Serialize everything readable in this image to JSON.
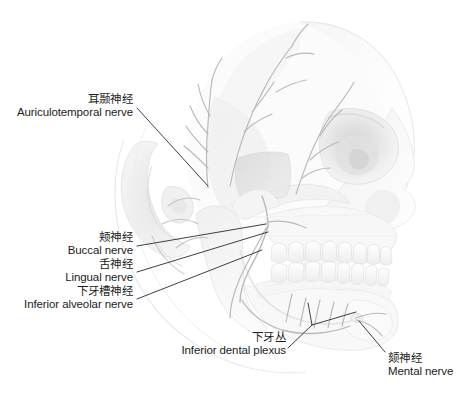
{
  "figure": {
    "type": "anatomical-illustration",
    "view": "lateral",
    "background_color": "#ffffff",
    "line_color": "#2a2a2a",
    "art_tone_light": "#fafafa",
    "art_tone_mid": "#e6e6e6",
    "art_tone_dark": "#c9c9c9"
  },
  "labels": [
    {
      "id": "auriculotemporal",
      "zh": "耳颞神经",
      "en": "Auriculotemporal nerve",
      "align": "right"
    },
    {
      "id": "buccal",
      "zh": "颊神经",
      "en": "Buccal nerve",
      "align": "right"
    },
    {
      "id": "lingual",
      "zh": "舌神经",
      "en": "Lingual nerve",
      "align": "right"
    },
    {
      "id": "inferior-alveolar",
      "zh": "下牙槽神经",
      "en": "Inferior alveolar nerve",
      "align": "right"
    },
    {
      "id": "inferior-dental-plexus",
      "zh": "下牙丛",
      "en": "Inferior dental plexus",
      "align": "right"
    },
    {
      "id": "mental",
      "zh": "颏神经",
      "en": "Mental nerve",
      "align": "left"
    }
  ]
}
